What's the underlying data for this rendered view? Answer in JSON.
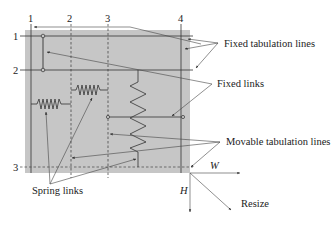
{
  "diagram": {
    "colors": {
      "panel": "#c6c6c6",
      "line": "#333333",
      "arrow": "#444444",
      "text": "#222222"
    },
    "column_labels": [
      "1",
      "2",
      "3",
      "4"
    ],
    "row_labels": [
      "1",
      "2",
      "3"
    ],
    "annotations": {
      "fixed_tabulation_lines": "Fixed tabulation lines",
      "fixed_links": "Fixed links",
      "movable_tabulation_lines": "Movable tabulation lines",
      "spring_links": "Spring links",
      "width": "W",
      "height": "H",
      "resize": "Resize"
    }
  }
}
